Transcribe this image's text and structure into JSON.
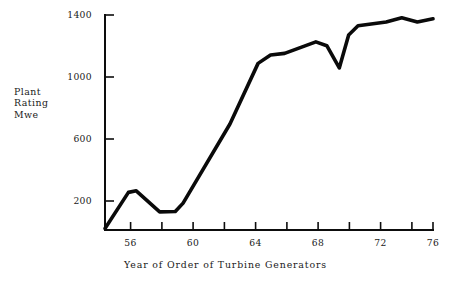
{
  "chart_data": {
    "type": "line",
    "title": "",
    "xlabel": "Year of Order of Turbine Generators",
    "ylabel": "Plant Rating Mwe",
    "ylabel_lines": [
      "Plant",
      "Rating",
      "Mwe"
    ],
    "xlim": [
      55,
      76
    ],
    "ylim": [
      0,
      1400
    ],
    "grid": false,
    "legend": null,
    "x_ticks": [
      56,
      58,
      60,
      62,
      64,
      66,
      68,
      70,
      72,
      74,
      76
    ],
    "x_tick_labels": [
      "56",
      "",
      "60",
      "",
      "64",
      "",
      "68",
      "",
      "72",
      "",
      "76"
    ],
    "y_ticks": [
      200,
      600,
      1000,
      1400
    ],
    "y_tick_labels": [
      "200",
      "600",
      "1000",
      "1400"
    ],
    "series": [
      {
        "name": "Plant Rating",
        "color": "#0a0a0a",
        "x": [
          55.0,
          56.5,
          57.0,
          58.5,
          59.5,
          60.0,
          63.0,
          64.8,
          65.6,
          66.5,
          68.5,
          69.2,
          70.0,
          70.6,
          71.2,
          73.0,
          74.0,
          75.0,
          76.0
        ],
        "y": [
          10,
          245,
          255,
          118,
          120,
          175,
          690,
          1085,
          1140,
          1150,
          1225,
          1200,
          1055,
          1270,
          1330,
          1355,
          1382,
          1355,
          1375
        ]
      }
    ]
  },
  "figure": {
    "background_color": "#ffffff",
    "line_color": "#0a0a0a",
    "axis_color": "#0d0d0d"
  }
}
